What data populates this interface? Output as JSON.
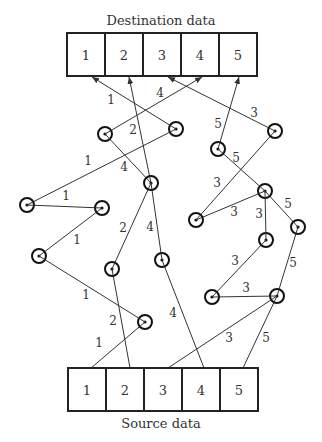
{
  "destination": {
    "title": "Destination data",
    "x": 67,
    "y": 33,
    "cell_w": 38,
    "cell_h": 43,
    "cells": [
      "1",
      "2",
      "3",
      "4",
      "5"
    ]
  },
  "source": {
    "title": "Source data",
    "x": 68,
    "y": 368,
    "cell_w": 38,
    "cell_h": 43,
    "cells": [
      "1",
      "2",
      "3",
      "4",
      "5"
    ]
  },
  "nodes": [
    {
      "id": "a",
      "x": 105,
      "y": 134
    },
    {
      "id": "b",
      "x": 176,
      "y": 129
    },
    {
      "id": "c",
      "x": 218,
      "y": 149
    },
    {
      "id": "d",
      "x": 275,
      "y": 131
    },
    {
      "id": "e",
      "x": 151,
      "y": 183
    },
    {
      "id": "f",
      "x": 27,
      "y": 205
    },
    {
      "id": "g",
      "x": 102,
      "y": 208
    },
    {
      "id": "h",
      "x": 265,
      "y": 191
    },
    {
      "id": "i",
      "x": 196,
      "y": 220
    },
    {
      "id": "j",
      "x": 298,
      "y": 227
    },
    {
      "id": "k",
      "x": 266,
      "y": 240
    },
    {
      "id": "l",
      "x": 39,
      "y": 256
    },
    {
      "id": "m",
      "x": 112,
      "y": 269
    },
    {
      "id": "n",
      "x": 162,
      "y": 260
    },
    {
      "id": "o",
      "x": 212,
      "y": 297
    },
    {
      "id": "p",
      "x": 277,
      "y": 296
    },
    {
      "id": "q",
      "x": 145,
      "y": 322
    }
  ],
  "edges": [
    {
      "from": "src1",
      "to": "q",
      "label": "1",
      "lx": 99,
      "ly": 347
    },
    {
      "from": "q",
      "to": "l",
      "label": "1",
      "lx": 86,
      "ly": 299
    },
    {
      "from": "l",
      "to": "g",
      "label": "1",
      "lx": 77,
      "ly": 244
    },
    {
      "from": "g",
      "to": "f",
      "label": "1",
      "lx": 66,
      "ly": 200
    },
    {
      "from": "f",
      "to": "b",
      "label": "1",
      "lx": 88,
      "ly": 165
    },
    {
      "from": "b",
      "to": "dst1",
      "label": "1",
      "lx": 111,
      "ly": 104
    },
    {
      "from": "src2",
      "to": "m",
      "label": "2",
      "lx": 113,
      "ly": 325
    },
    {
      "from": "m",
      "to": "e",
      "label": "2",
      "lx": 123,
      "ly": 232
    },
    {
      "from": "e",
      "to": "dst2",
      "label": "2",
      "lx": 133,
      "ly": 134
    },
    {
      "from": "src4",
      "to": "n",
      "label": "4",
      "lx": 173,
      "ly": 317
    },
    {
      "from": "n",
      "to": "e",
      "label": "4",
      "lx": 150,
      "ly": 231
    },
    {
      "from": "e",
      "to": "a",
      "label": "4",
      "lx": 124,
      "ly": 171
    },
    {
      "from": "a",
      "to": "dst4",
      "label": "4",
      "lx": 160,
      "ly": 97
    },
    {
      "from": "src3",
      "to": "p",
      "label": "3",
      "lx": 229,
      "ly": 342
    },
    {
      "from": "p",
      "to": "o",
      "label": "3",
      "lx": 246,
      "ly": 292
    },
    {
      "from": "o",
      "to": "k",
      "label": "3",
      "lx": 235,
      "ly": 265
    },
    {
      "from": "k",
      "to": "h",
      "label": "3",
      "lx": 259,
      "ly": 218
    },
    {
      "from": "h",
      "to": "i",
      "label": "3",
      "lx": 234,
      "ly": 216
    },
    {
      "from": "i",
      "to": "d",
      "label": "3",
      "lx": 217,
      "ly": 187
    },
    {
      "from": "d",
      "to": "dst3",
      "label": "3",
      "lx": 254,
      "ly": 117
    },
    {
      "from": "src5",
      "to": "p",
      "label": "5",
      "lx": 266,
      "ly": 342
    },
    {
      "from": "p",
      "to": "j",
      "label": "5",
      "lx": 293,
      "ly": 267
    },
    {
      "from": "j",
      "to": "h",
      "label": "5",
      "lx": 288,
      "ly": 208
    },
    {
      "from": "h",
      "to": "c",
      "label": "5",
      "lx": 236,
      "ly": 162
    },
    {
      "from": "c",
      "to": "dst5",
      "label": "5",
      "lx": 218,
      "ly": 128
    }
  ],
  "style": {
    "line_color": "#333333",
    "box_color": "#222222",
    "node_radius": 7
  }
}
